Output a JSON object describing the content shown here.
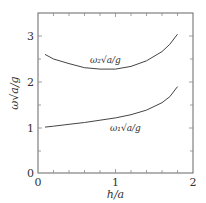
{
  "chart_data": {
    "type": "line",
    "title": "",
    "xlabel": "h/a",
    "ylabel": "ω√(a/g)",
    "xlim": [
      0,
      2
    ],
    "ylim": [
      0,
      3.5
    ],
    "xticks": [
      "0",
      "1",
      "2"
    ],
    "yticks": [
      "0",
      "1",
      "2",
      "3"
    ],
    "grid": false,
    "legend": "none (inline curve labels)",
    "series": [
      {
        "name": "ω2√(a/g)",
        "x": [
          0.09,
          0.2,
          0.4,
          0.6,
          0.8,
          1.0,
          1.2,
          1.4,
          1.6,
          1.7,
          1.8
        ],
        "values": [
          2.6,
          2.5,
          2.4,
          2.31,
          2.28,
          2.28,
          2.34,
          2.46,
          2.66,
          2.82,
          3.04
        ]
      },
      {
        "name": "ω1√(a/g)",
        "x": [
          0.09,
          0.2,
          0.4,
          0.6,
          0.8,
          1.0,
          1.2,
          1.4,
          1.6,
          1.7,
          1.8
        ],
        "values": [
          1.02,
          1.04,
          1.08,
          1.12,
          1.17,
          1.22,
          1.29,
          1.39,
          1.55,
          1.68,
          1.9
        ]
      }
    ],
    "annotations": [
      "ω2√(a/g)",
      "ω1√(a/g)"
    ]
  },
  "labels": {
    "x_axis": "h/a",
    "y_axis": "ω√a/g",
    "x_ticks": [
      "0",
      "1",
      "2"
    ],
    "y_ticks": [
      "0",
      "1",
      "2",
      "3"
    ],
    "curve2": "ω₂√a/g",
    "curve1": "ω₁√a/g"
  }
}
